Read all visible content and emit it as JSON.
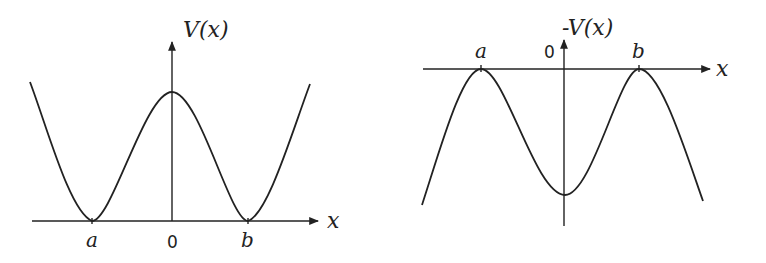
{
  "left_plot": {
    "y_label": "V(x)",
    "x_label": "x",
    "ticks": {
      "a": "a",
      "origin": "0",
      "b": "b"
    },
    "description": "Double-well potential V(x) with minima at x=a and x=b, local maximum at x=0"
  },
  "right_plot": {
    "y_label": "-V(x)",
    "x_label": "x",
    "ticks": {
      "a": "a",
      "origin": "0",
      "b": "b"
    },
    "description": "Inverted potential -V(x) with maxima at x=a and x=b, local minimum at x=0"
  },
  "colors": {
    "stroke": "#222222",
    "background": "#ffffff"
  }
}
